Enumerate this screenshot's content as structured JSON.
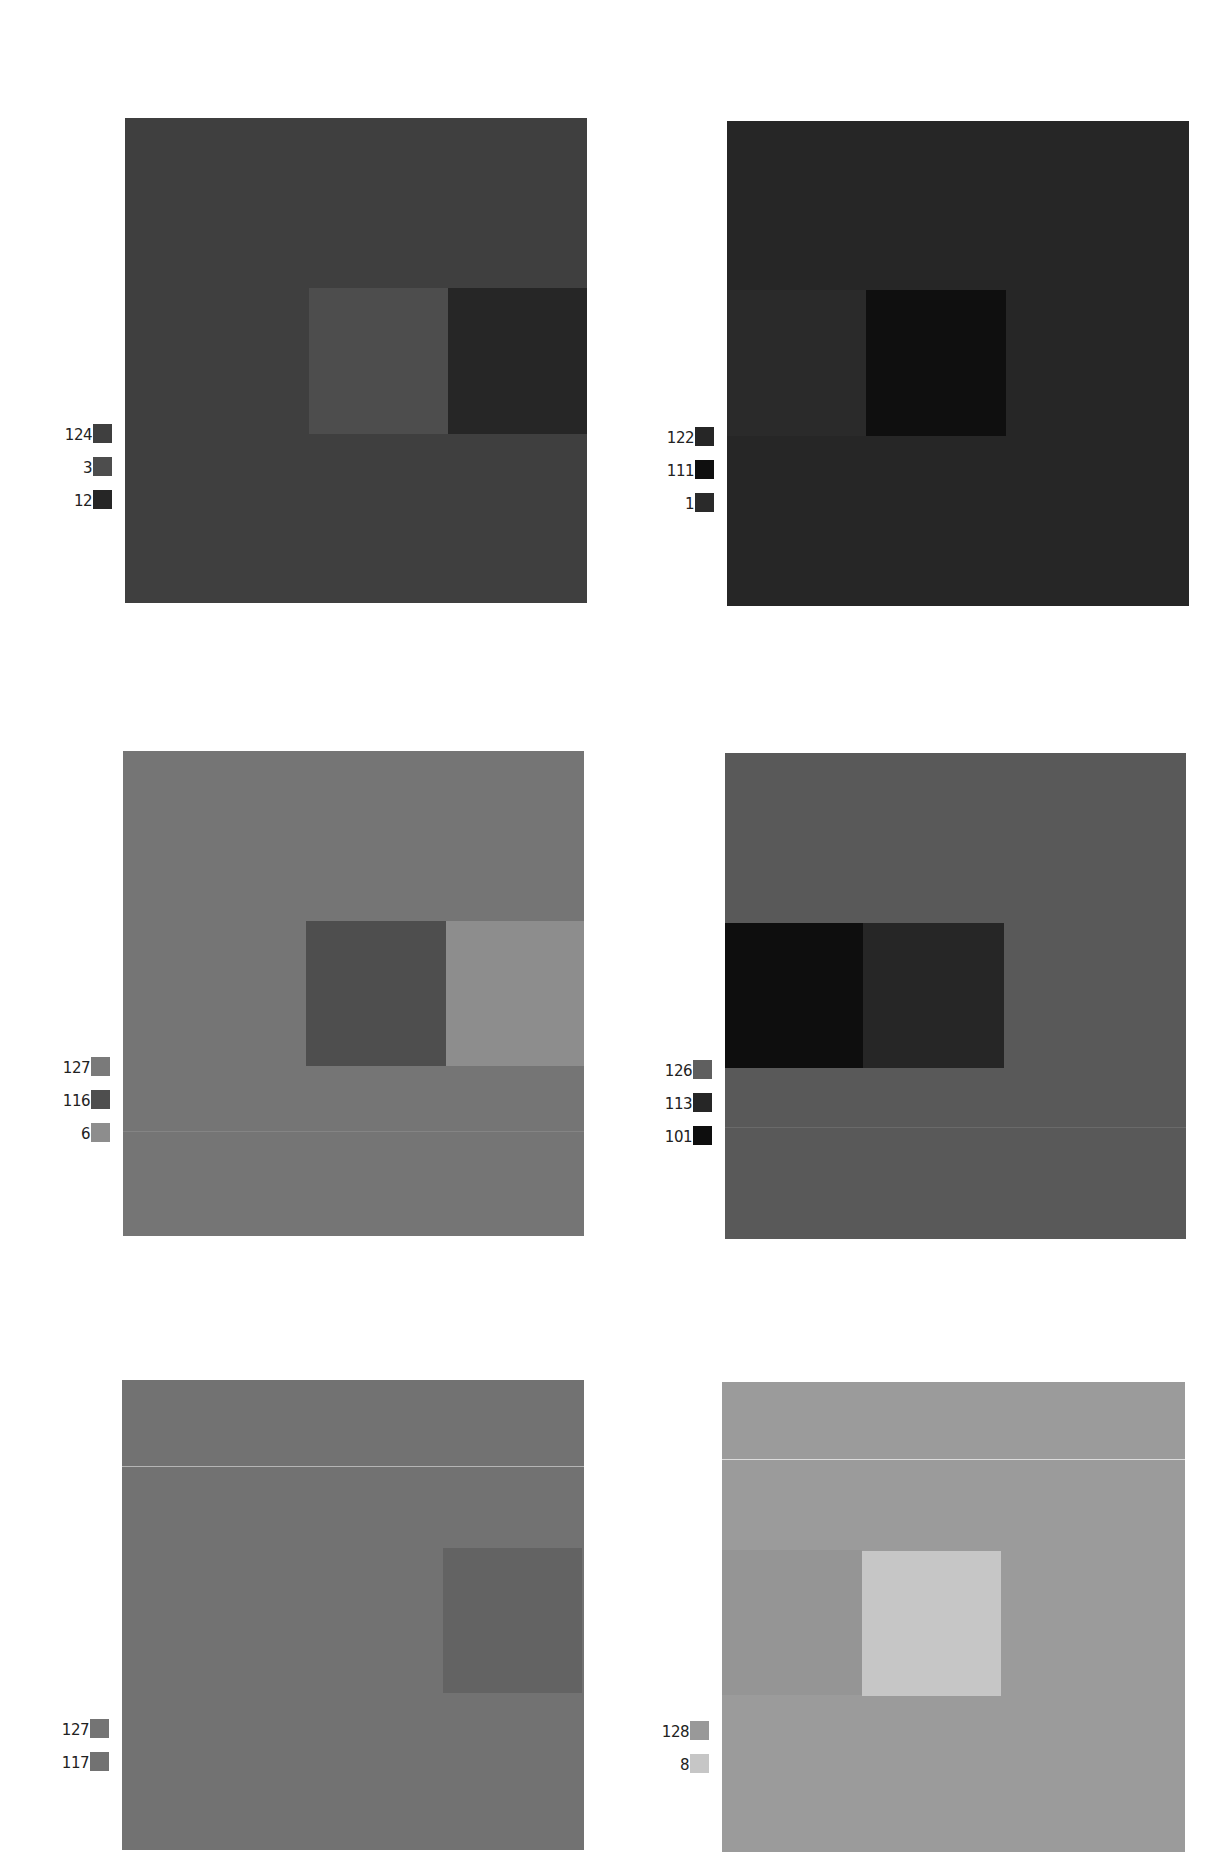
{
  "plates": [
    {
      "id": "top-left",
      "panel": {
        "x": 125,
        "y": 118,
        "w": 462,
        "h": 485,
        "color": "#3f3f3f"
      },
      "inner": [
        {
          "x": 184,
          "y": 170,
          "w": 140,
          "h": 146,
          "color": "#4d4d4d"
        },
        {
          "x": 323,
          "y": 170,
          "w": 139,
          "h": 146,
          "color": "#262626"
        }
      ],
      "lines": [],
      "legend": {
        "x": 52,
        "y": 514,
        "items": [
          {
            "label": "124",
            "color": "#3f3f3f"
          },
          {
            "label": "3",
            "color": "#4d4d4d"
          },
          {
            "label": "12",
            "color": "#262626"
          }
        ]
      }
    },
    {
      "id": "top-right",
      "panel": {
        "x": 727,
        "y": 121,
        "w": 462,
        "h": 485,
        "color": "#262626"
      },
      "inner": [
        {
          "x": 0,
          "y": 169,
          "w": 139,
          "h": 146,
          "color": "#2a2a2a"
        },
        {
          "x": 139,
          "y": 169,
          "w": 140,
          "h": 146,
          "color": "#0f0f0f"
        }
      ],
      "lines": [],
      "legend": {
        "x": 654,
        "y": 517,
        "items": [
          {
            "label": "122",
            "color": "#262626"
          },
          {
            "label": "111",
            "color": "#0f0f0f"
          },
          {
            "label": "1",
            "color": "#2a2a2a"
          }
        ]
      }
    },
    {
      "id": "middle-left",
      "panel": {
        "x": 123,
        "y": 751,
        "w": 461,
        "h": 485,
        "color": "#757575"
      },
      "inner": [
        {
          "x": 183,
          "y": 170,
          "w": 140,
          "h": 145,
          "color": "#4e4e4e"
        },
        {
          "x": 323,
          "y": 170,
          "w": 138,
          "h": 145,
          "color": "#8d8d8d"
        }
      ],
      "lines": [
        {
          "y": 380,
          "color": "#848484"
        }
      ],
      "legend": {
        "x": 50,
        "y": 1147,
        "items": [
          {
            "label": "127",
            "color": "#7a7a7a"
          },
          {
            "label": "116",
            "color": "#4e4e4e"
          },
          {
            "label": "6",
            "color": "#8d8d8d"
          }
        ]
      }
    },
    {
      "id": "middle-right",
      "panel": {
        "x": 725,
        "y": 753,
        "w": 461,
        "h": 486,
        "color": "#595959"
      },
      "inner": [
        {
          "x": 0,
          "y": 170,
          "w": 138,
          "h": 145,
          "color": "#0e0e0e"
        },
        {
          "x": 138,
          "y": 170,
          "w": 141,
          "h": 145,
          "color": "#262626"
        }
      ],
      "lines": [
        {
          "y": 374,
          "color": "#6a6a6a"
        }
      ],
      "legend": {
        "x": 652,
        "y": 1150,
        "items": [
          {
            "label": "126",
            "color": "#5f5f5f"
          },
          {
            "label": "113",
            "color": "#262626"
          },
          {
            "label": "101",
            "color": "#0e0e0e"
          }
        ]
      }
    },
    {
      "id": "bottom-left",
      "panel": {
        "x": 122,
        "y": 1380,
        "w": 462,
        "h": 470,
        "color": "#727272"
      },
      "inner": [
        {
          "x": 321,
          "y": 168,
          "w": 139,
          "h": 145,
          "color": "#636363"
        }
      ],
      "lines": [
        {
          "y": 86,
          "color": "#b5b5b5"
        }
      ],
      "legend": {
        "x": 49,
        "y": 1776,
        "items": [
          {
            "label": "127",
            "color": "#747474"
          },
          {
            "label": "117",
            "color": "#727272"
          }
        ]
      }
    },
    {
      "id": "bottom-right",
      "panel": {
        "x": 722,
        "y": 1382,
        "w": 463,
        "h": 470,
        "color": "#9b9b9b"
      },
      "inner": [
        {
          "x": 0,
          "y": 168,
          "w": 140,
          "h": 145,
          "color": "#959595"
        },
        {
          "x": 140,
          "y": 169,
          "w": 139,
          "h": 145,
          "color": "#c6c6c6"
        }
      ],
      "lines": [
        {
          "y": 77,
          "color": "#dcdcdc"
        }
      ],
      "legend": {
        "x": 649,
        "y": 1778,
        "items": [
          {
            "label": "128",
            "color": "#999999"
          },
          {
            "label": "8",
            "color": "#c6c6c6"
          }
        ]
      }
    }
  ]
}
